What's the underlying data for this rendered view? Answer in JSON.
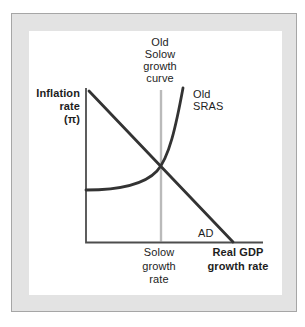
{
  "figure": {
    "type": "economics-diagram",
    "labels": {
      "inflation_axis": "Inflation\nrate\n(π)",
      "old_solow_growth_curve": "Old\nSolow\ngrowth\ncurve",
      "old_sras": "Old\nSRAS",
      "ad": "AD",
      "solow_growth_rate": "Solow\ngrowth\nrate",
      "real_gdp_axis": "Real GDP\ngrowth rate"
    },
    "curves": [
      {
        "name": "AD",
        "shape": "downward-sloping straight line"
      },
      {
        "name": "Old SRAS",
        "shape": "flat at left, curving steeply upward"
      },
      {
        "name": "Old Solow growth curve",
        "shape": "vertical line at Solow growth rate"
      }
    ],
    "colors": {
      "curve": "#333333",
      "axis": "#4d4d4d",
      "solow_line": "#bababa",
      "frame_band": "#e3e3e3",
      "frame_outline": "#a6a6a6",
      "text": "#1d1d1d"
    }
  }
}
